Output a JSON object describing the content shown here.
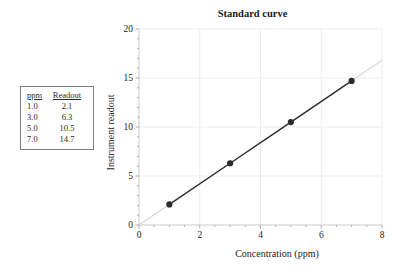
{
  "table": {
    "headers": [
      "ppm",
      "Readout"
    ],
    "rows": [
      [
        "1.0",
        "2.1"
      ],
      [
        "3.0",
        "6.3"
      ],
      [
        "5.0",
        "10.5"
      ],
      [
        "7.0",
        "14.7"
      ]
    ]
  },
  "chart_data": {
    "type": "scatter",
    "title": "Standard curve",
    "xlabel": "Concentration (ppm)",
    "ylabel": "Instrument readout",
    "x": [
      1.0,
      3.0,
      5.0,
      7.0
    ],
    "y": [
      2.1,
      6.3,
      10.5,
      14.7
    ],
    "xlim": [
      0,
      8
    ],
    "ylim": [
      0,
      20
    ],
    "x_major_ticks": [
      0,
      2,
      4,
      6,
      8
    ],
    "y_major_ticks": [
      0,
      5,
      10,
      15,
      20
    ],
    "x_minor_step": 0.5,
    "y_minor_step": 1,
    "grid": true,
    "legend": "none",
    "fit_line": {
      "slope": 2.1,
      "intercept": 0.0,
      "x_range": [
        0,
        8
      ]
    },
    "colors": {
      "point": "#2b2b2b",
      "data_line": "#2e2e2e",
      "fit_line": "#d7d7d7",
      "grid": "#ededed",
      "axis": "#c9c9c9",
      "tick": "#a5a5a5",
      "text": "#1c1c1c"
    }
  }
}
